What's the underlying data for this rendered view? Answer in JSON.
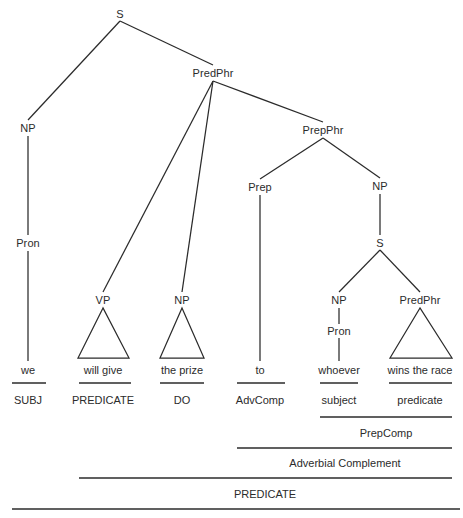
{
  "diagram": {
    "sentence": "we will give the prize to whoever wins the race",
    "ink_color": "#2b2b2b",
    "background_color": "#ffffff"
  },
  "nodes": [
    {
      "id": "s-root",
      "label": "S",
      "x": 120,
      "y": 14
    },
    {
      "id": "np-subject",
      "label": "NP",
      "x": 28,
      "y": 128
    },
    {
      "id": "pron-subject",
      "label": "Pron",
      "x": 28,
      "y": 243
    },
    {
      "id": "predphr-main",
      "label": "PredPhr",
      "x": 213,
      "y": 73
    },
    {
      "id": "vp-main",
      "label": "VP",
      "x": 103,
      "y": 300
    },
    {
      "id": "np-object",
      "label": "NP",
      "x": 182,
      "y": 300
    },
    {
      "id": "prepphr",
      "label": "PrepPhr",
      "x": 323,
      "y": 130
    },
    {
      "id": "prep",
      "label": "Prep",
      "x": 260,
      "y": 187
    },
    {
      "id": "np-prepcomp",
      "label": "NP",
      "x": 380,
      "y": 186
    },
    {
      "id": "s-embedded",
      "label": "S",
      "x": 380,
      "y": 243
    },
    {
      "id": "np-embedded-subj",
      "label": "NP",
      "x": 339,
      "y": 300
    },
    {
      "id": "pron-embedded",
      "label": "Pron",
      "x": 339,
      "y": 331
    },
    {
      "id": "predphr-embedded",
      "label": "PredPhr",
      "x": 420,
      "y": 300
    }
  ],
  "edges": [
    {
      "from": "s-root",
      "to": "np-subject",
      "x1": 120,
      "y1": 21,
      "x2": 28,
      "y2": 120
    },
    {
      "from": "s-root",
      "to": "predphr-main",
      "x1": 120,
      "y1": 21,
      "x2": 213,
      "y2": 65
    },
    {
      "from": "np-subject",
      "to": "pron-subject",
      "x1": 28,
      "y1": 136,
      "x2": 28,
      "y2": 235
    },
    {
      "from": "pron-subject",
      "to": "we",
      "x1": 28,
      "y1": 251,
      "x2": 28,
      "y2": 361
    },
    {
      "from": "predphr-main",
      "to": "vp-main",
      "x1": 213,
      "y1": 81,
      "x2": 103,
      "y2": 292
    },
    {
      "from": "predphr-main",
      "to": "np-object",
      "x1": 213,
      "y1": 81,
      "x2": 182,
      "y2": 292
    },
    {
      "from": "predphr-main",
      "to": "prepphr",
      "x1": 213,
      "y1": 81,
      "x2": 323,
      "y2": 122
    },
    {
      "from": "prepphr",
      "to": "prep",
      "x1": 323,
      "y1": 138,
      "x2": 260,
      "y2": 179
    },
    {
      "from": "prepphr",
      "to": "np-prepcomp",
      "x1": 323,
      "y1": 138,
      "x2": 380,
      "y2": 178
    },
    {
      "from": "prep",
      "to": "to",
      "x1": 260,
      "y1": 195,
      "x2": 260,
      "y2": 361
    },
    {
      "from": "np-prepcomp",
      "to": "s-embedded",
      "x1": 380,
      "y1": 194,
      "x2": 380,
      "y2": 235
    },
    {
      "from": "s-embedded",
      "to": "np-embedded-subj",
      "x1": 380,
      "y1": 250,
      "x2": 339,
      "y2": 292
    },
    {
      "from": "s-embedded",
      "to": "predphr-embedded",
      "x1": 380,
      "y1": 250,
      "x2": 420,
      "y2": 292
    },
    {
      "from": "np-embedded-subj",
      "to": "pron-embedded",
      "x1": 339,
      "y1": 308,
      "x2": 339,
      "y2": 324
    },
    {
      "from": "pron-embedded",
      "to": "whoever",
      "x1": 339,
      "y1": 338,
      "x2": 339,
      "y2": 361
    }
  ],
  "triangles": [
    {
      "id": "tri-vp",
      "apex_x": 103,
      "apex_y": 308,
      "left_x": 78,
      "right_x": 129,
      "base_y": 358
    },
    {
      "id": "tri-np",
      "apex_x": 182,
      "apex_y": 308,
      "left_x": 160,
      "right_x": 204,
      "base_y": 358
    },
    {
      "id": "tri-predphr",
      "apex_x": 420,
      "apex_y": 308,
      "left_x": 390,
      "right_x": 452,
      "base_y": 358
    }
  ],
  "leaves": [
    {
      "id": "leaf-we",
      "text": "we",
      "x": 28,
      "y": 370
    },
    {
      "id": "leaf-will-give",
      "text": "will give",
      "x": 103,
      "y": 370
    },
    {
      "id": "leaf-the-prize",
      "text": "the prize",
      "x": 182,
      "y": 370
    },
    {
      "id": "leaf-to",
      "text": "to",
      "x": 260,
      "y": 370
    },
    {
      "id": "leaf-whoever",
      "text": "whoever",
      "x": 339,
      "y": 370
    },
    {
      "id": "leaf-wins-the-race",
      "text": "wins the race",
      "x": 420,
      "y": 370
    }
  ],
  "function_labels": [
    {
      "id": "func-subj",
      "text": "SUBJ",
      "x": 28,
      "y": 400,
      "bar_x1": 12,
      "bar_x2": 46,
      "bar_y": 383
    },
    {
      "id": "func-predicate",
      "text": "PREDICATE",
      "x": 103,
      "y": 400,
      "bar_x1": 79,
      "bar_x2": 131,
      "bar_y": 383
    },
    {
      "id": "func-do",
      "text": "DO",
      "x": 182,
      "y": 400,
      "bar_x1": 160,
      "bar_x2": 204,
      "bar_y": 383
    },
    {
      "id": "func-advcomp",
      "text": "AdvComp",
      "x": 260,
      "y": 400,
      "bar_x1": 237,
      "bar_x2": 285,
      "bar_y": 383
    },
    {
      "id": "func-subject",
      "text": "subject",
      "x": 339,
      "y": 400,
      "bar_x1": 320,
      "bar_x2": 358,
      "bar_y": 383
    },
    {
      "id": "func-predicate2",
      "text": "predicate",
      "x": 420,
      "y": 400,
      "bar_x1": 389,
      "bar_x2": 452,
      "bar_y": 383
    }
  ],
  "bracket_rows": [
    {
      "id": "row-prepcomp",
      "text": "PrepComp",
      "label_x": 386,
      "label_y": 433,
      "bar_x1": 320,
      "bar_x2": 452,
      "bar_y": 417,
      "weight": "normal"
    },
    {
      "id": "row-advcomp",
      "text": "Adverbial Complement",
      "label_x": 345,
      "label_y": 463,
      "bar_x1": 237,
      "bar_x2": 452,
      "bar_y": 448,
      "weight": "normal"
    },
    {
      "id": "row-predicate",
      "text": "PREDICATE",
      "label_x": 265,
      "label_y": 494,
      "bar_x1": 79,
      "bar_x2": 452,
      "bar_y": 478,
      "weight": "normal"
    },
    {
      "id": "row-sentence",
      "text": "",
      "label_x": 232,
      "label_y": 514,
      "bar_x1": 12,
      "bar_x2": 460,
      "bar_y": 509,
      "weight": "heavy"
    }
  ]
}
